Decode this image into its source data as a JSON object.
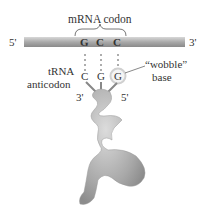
{
  "title": "mRNA codon",
  "mrna": {
    "left_end": "5'",
    "right_end": "3'",
    "bases": [
      "G",
      "C",
      "C"
    ]
  },
  "trna": {
    "label_line1": "tRNA",
    "label_line2": "anticodon",
    "bases": [
      "C",
      "G",
      "G"
    ],
    "left_end": "3'",
    "right_end": "5'"
  },
  "wobble": {
    "label_line1": "“wobble”",
    "label_line2": "base"
  }
}
